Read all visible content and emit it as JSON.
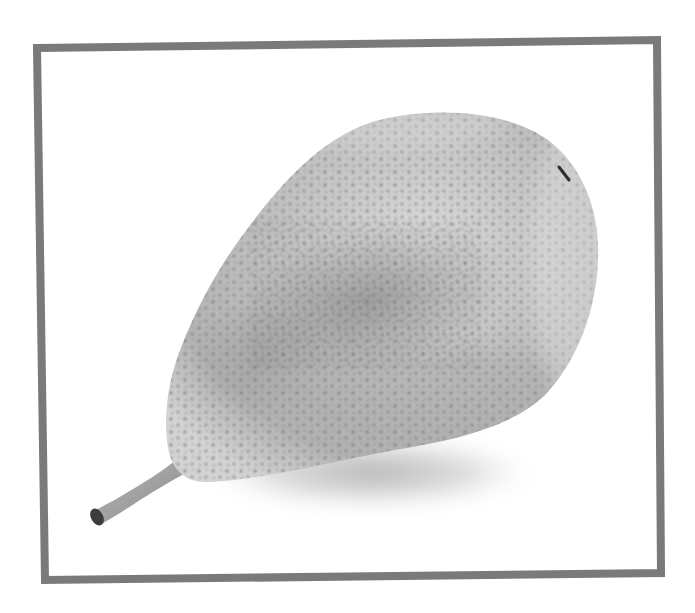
{
  "image": {
    "subject": "pear",
    "description": "Black-and-white photo of a single speckled pear lying on its side, stem pointing to the lower left, inside a gray rectangular frame",
    "colors": {
      "background": "#ffffff",
      "frame": "#7a7a7a",
      "pear_light": "#d8d8d8",
      "pear_mid": "#b5b5b5",
      "pear_dark": "#8f8f8f",
      "speckle": "#6f6f6f",
      "stem": "#9a9a9a",
      "stem_tip": "#3a3a3a",
      "shadow": "#c4c4c4"
    }
  }
}
